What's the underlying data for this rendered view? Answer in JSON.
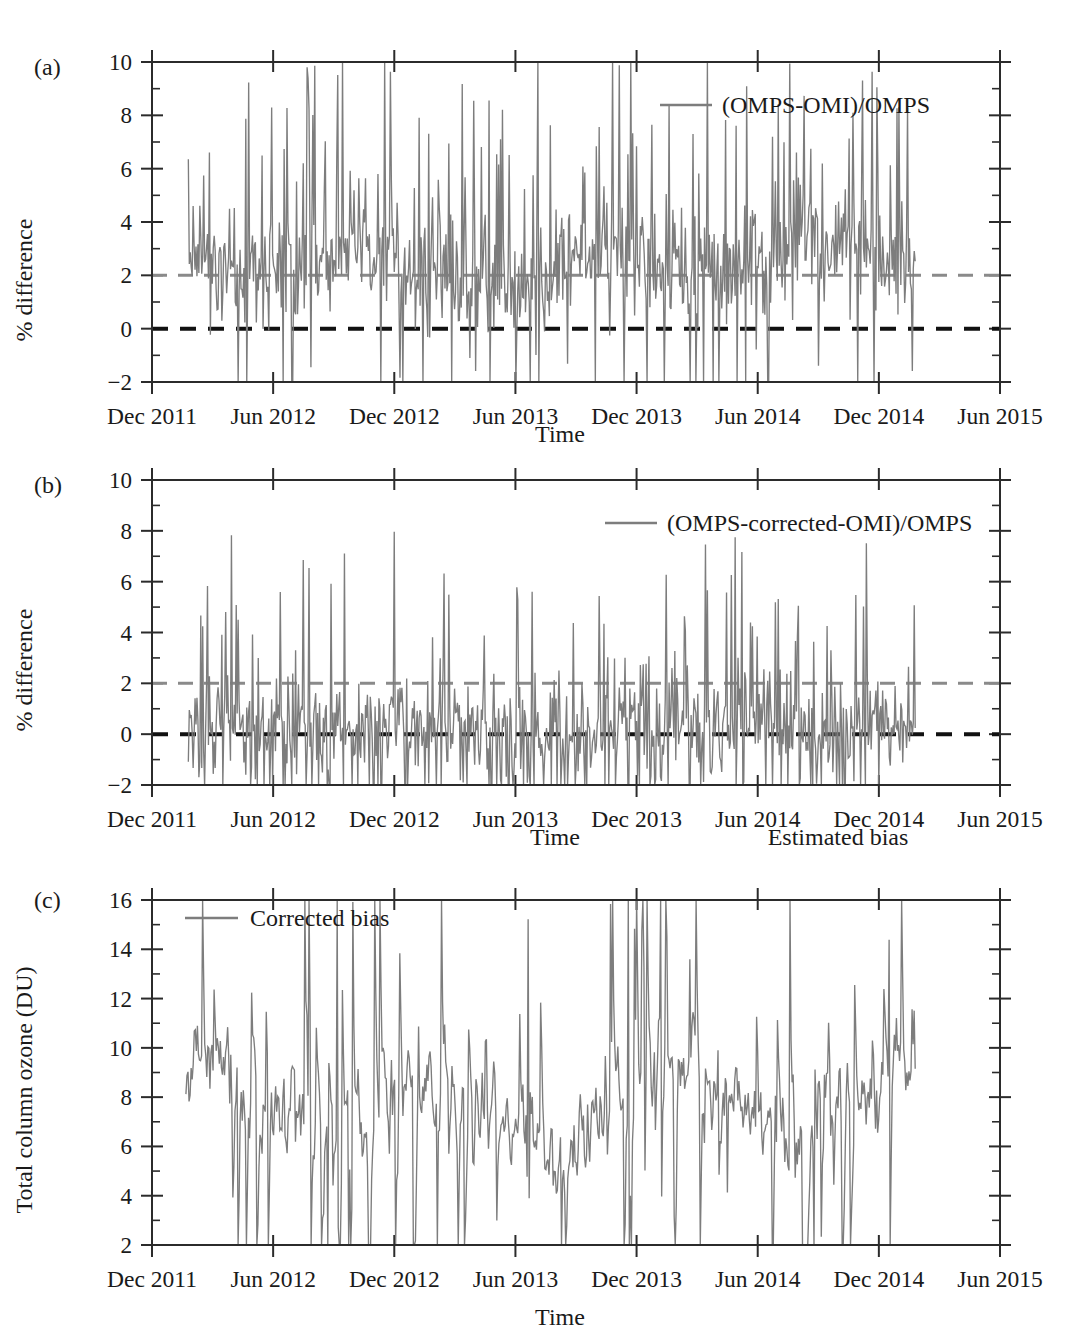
{
  "figure": {
    "panels": [
      {
        "tag": "(a)",
        "ylabel": "% difference",
        "xlabel": "Time",
        "legend": "(OMPS-OMI)/OMPS",
        "extra_label": ""
      },
      {
        "tag": "(b)",
        "ylabel": "% difference",
        "xlabel": "Time",
        "legend": "(OMPS-corrected-OMI)/OMPS",
        "extra_label": "Estimated bias"
      },
      {
        "tag": "(c)",
        "ylabel": "Total column ozone (DU)",
        "xlabel": "Time",
        "legend": "Corrected bias",
        "extra_label": ""
      }
    ],
    "colors": {
      "series": "#7d7d7d",
      "axis": "#2b2b2b",
      "reference_gray": "#8a8a8a",
      "reference_black": "#111111",
      "background": "#ffffff"
    }
  },
  "chart_data": [
    {
      "type": "line",
      "panel": "(a)",
      "title": "",
      "xlabel": "Time",
      "ylabel": "% difference",
      "legend": [
        "(OMPS-OMI)/OMPS"
      ],
      "legend_position": "top-right",
      "grid": false,
      "xlim": [
        2011.92,
        2015.42
      ],
      "ylim": [
        -2,
        10
      ],
      "yticks": [
        -2,
        0,
        2,
        4,
        6,
        8,
        10
      ],
      "ytick_labels": [
        "−2",
        "0",
        "2",
        "4",
        "6",
        "8",
        "10"
      ],
      "xticks": [
        2011.92,
        2012.42,
        2012.92,
        2013.42,
        2013.92,
        2014.42,
        2014.92,
        2015.42
      ],
      "xtick_labels": [
        "Dec 2011",
        "Jun 2012",
        "Dec 2012",
        "Jun 2013",
        "Dec 2013",
        "Jun 2014",
        "Dec 2014",
        "Jun 2015"
      ],
      "reference_lines": [
        {
          "y": 2,
          "style": "dashed",
          "color": "#8a8a8a"
        },
        {
          "y": 0,
          "style": "dashed",
          "color": "#111111"
        }
      ],
      "data_start": 2012.07,
      "data_end": 2015.07,
      "series": [
        {
          "name": "(OMPS-OMI)/OMPS",
          "mean": 2.3,
          "noise": 1.05,
          "spike_up": 0.14,
          "spike_down": 0.07,
          "clip": [
            -2,
            10
          ],
          "n": 760,
          "seasonal_amp": 0.55,
          "seasonal_phase": 0.45
        }
      ]
    },
    {
      "type": "line",
      "panel": "(b)",
      "title": "",
      "xlabel": "Time",
      "ylabel": "% difference",
      "legend": [
        "(OMPS-corrected-OMI)/OMPS"
      ],
      "legend_position": "top-right",
      "grid": false,
      "xlim": [
        2011.92,
        2015.42
      ],
      "ylim": [
        -2,
        10
      ],
      "yticks": [
        -2,
        0,
        2,
        4,
        6,
        8,
        10
      ],
      "ytick_labels": [
        "−2",
        "0",
        "2",
        "4",
        "6",
        "8",
        "10"
      ],
      "xticks": [
        2011.92,
        2012.42,
        2012.92,
        2013.42,
        2013.92,
        2014.42,
        2014.92,
        2015.42
      ],
      "xtick_labels": [
        "Dec 2011",
        "Jun 2012",
        "Dec 2012",
        "Jun 2013",
        "Dec 2013",
        "Jun 2014",
        "Dec 2014",
        "Jun 2015"
      ],
      "reference_lines": [
        {
          "y": 2,
          "style": "dashed",
          "color": "#8a8a8a"
        },
        {
          "y": 0,
          "style": "dashed",
          "color": "#111111"
        }
      ],
      "data_start": 2012.07,
      "data_end": 2015.07,
      "series": [
        {
          "name": "(OMPS-corrected-OMI)/OMPS",
          "mean": 0.35,
          "noise": 1.0,
          "spike_up": 0.1,
          "spike_down": 0.12,
          "clip": [
            -2,
            10
          ],
          "n": 760,
          "seasonal_amp": 0.18,
          "seasonal_phase": 0.3
        }
      ]
    },
    {
      "type": "line",
      "panel": "(c)",
      "title": "",
      "xlabel": "Time",
      "ylabel": "Total column ozone (DU)",
      "legend": [
        "Corrected bias"
      ],
      "legend_position": "top-left",
      "grid": false,
      "xlim": [
        2011.92,
        2015.42
      ],
      "ylim": [
        2,
        16
      ],
      "yticks": [
        2,
        4,
        6,
        8,
        10,
        12,
        14,
        16
      ],
      "ytick_labels": [
        "2",
        "4",
        "6",
        "8",
        "10",
        "12",
        "14",
        "16"
      ],
      "xticks": [
        2011.92,
        2012.42,
        2012.92,
        2013.42,
        2013.92,
        2014.42,
        2014.92,
        2015.42
      ],
      "xtick_labels": [
        "Dec 2011",
        "Jun 2012",
        "Dec 2012",
        "Jun 2013",
        "Dec 2013",
        "Jun 2014",
        "Dec 2014",
        "Jun 2015"
      ],
      "reference_lines": [],
      "data_start": 2012.06,
      "data_end": 2015.07,
      "series": [
        {
          "name": "Corrected bias",
          "mean": 7.6,
          "noise": 1.6,
          "spike_up": 0.07,
          "spike_down": 0.07,
          "clip": [
            2,
            16
          ],
          "n": 700,
          "seasonal_amp": 1.15,
          "seasonal_phase": 0.2,
          "smooth": 0.45
        }
      ]
    }
  ]
}
